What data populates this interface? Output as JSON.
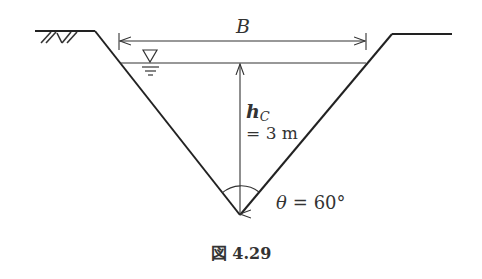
{
  "figure": {
    "caption": "図 4.29",
    "labels": {
      "width": "B",
      "depth_symbol": "h",
      "depth_subscript": "C",
      "depth_value": "= 3 m",
      "angle_symbol": "θ",
      "angle_value": "= 60°"
    },
    "geometry": {
      "shape": "triangular (V-shaped) channel",
      "apex_angle_deg": 60,
      "critical_depth_m": 3
    },
    "colors": {
      "line": "#222222",
      "text": "#333333",
      "background": "#ffffff"
    }
  }
}
